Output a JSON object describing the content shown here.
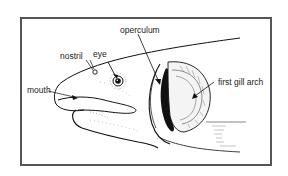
{
  "figure": {
    "labels": {
      "nostril": "nostril",
      "eye": "eye",
      "operculum": "operculum",
      "mouth": "mouth",
      "first_gill_arch": "first gill arch"
    }
  },
  "colors": {
    "frame": "#555555",
    "ink": "#111111",
    "background": "#ffffff"
  }
}
